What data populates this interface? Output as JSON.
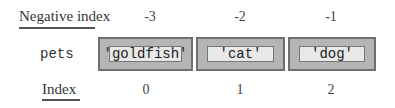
{
  "labels": {
    "negative_index": "Negative index",
    "variable": "pets",
    "index": "Index"
  },
  "items": [
    {
      "value": "'goldfish'",
      "negative_index": "-3",
      "index": "0"
    },
    {
      "value": "'cat'",
      "negative_index": "-2",
      "index": "1"
    },
    {
      "value": "'dog'",
      "negative_index": "-1",
      "index": "2"
    }
  ]
}
